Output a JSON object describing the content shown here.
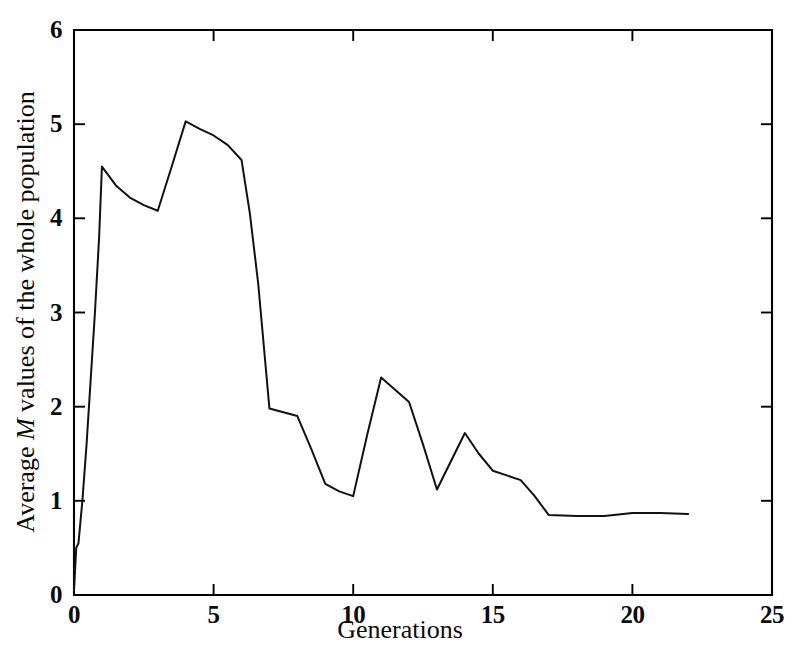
{
  "figure": {
    "background_color": "#ffffff",
    "line_color": "#111111",
    "axis_color": "#000000"
  },
  "axes": {
    "x_title": "Generations",
    "y_title_before": "Average ",
    "y_title_italic": "M",
    "y_title_after": " values of the whole population",
    "x_ticks": [
      "0",
      "5",
      "10",
      "15",
      "20",
      "25"
    ],
    "y_ticks": [
      "0",
      "1",
      "2",
      "3",
      "4",
      "5",
      "6"
    ]
  },
  "chart_data": {
    "type": "line",
    "title": "",
    "xlabel": "Generations",
    "ylabel": "Average M values of the whole population",
    "xlim": [
      0,
      25
    ],
    "ylim": [
      0,
      6
    ],
    "xticks": [
      0,
      5,
      10,
      15,
      20,
      25
    ],
    "yticks": [
      0,
      1,
      2,
      3,
      4,
      5,
      6
    ],
    "grid": false,
    "legend": "none",
    "series": [
      {
        "name": "Average M value",
        "x": [
          0.0,
          0.08,
          0.16,
          0.3,
          0.45,
          0.6,
          0.75,
          0.9,
          1.0,
          1.5,
          2.0,
          2.5,
          3.0,
          3.5,
          4.0,
          4.5,
          5.0,
          5.5,
          6.0,
          6.3,
          6.6,
          7.0,
          7.5,
          8.0,
          8.5,
          9.0,
          9.5,
          10.0,
          10.5,
          11.0,
          11.5,
          12.0,
          12.5,
          13.0,
          13.5,
          14.0,
          14.5,
          15.0,
          15.5,
          16.0,
          16.5,
          17.0,
          18.0,
          19.0,
          20.0,
          21.0,
          22.0
        ],
        "y": [
          0.05,
          0.5,
          0.55,
          1.0,
          1.6,
          2.3,
          3.0,
          3.8,
          4.55,
          4.35,
          4.22,
          4.14,
          4.08,
          4.55,
          5.03,
          4.95,
          4.88,
          4.78,
          4.62,
          4.05,
          3.3,
          1.98,
          1.94,
          1.9,
          1.55,
          1.18,
          1.1,
          1.05,
          1.7,
          2.31,
          2.18,
          2.05,
          1.6,
          1.12,
          1.42,
          1.72,
          1.5,
          1.32,
          1.27,
          1.22,
          1.05,
          0.85,
          0.84,
          0.84,
          0.87,
          0.87,
          0.86
        ]
      }
    ]
  }
}
